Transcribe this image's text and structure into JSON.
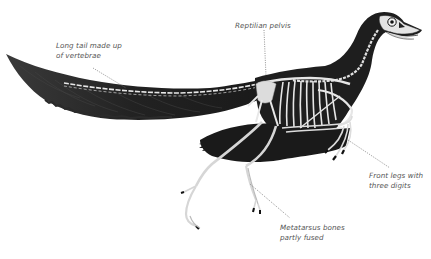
{
  "diagram": {
    "labels": [
      {
        "id": "tail",
        "line1": "Long tail made up",
        "line2": "of vertebrae"
      },
      {
        "id": "pelvis",
        "line1": "Reptilian pelvis"
      },
      {
        "id": "front_legs",
        "line1": "Front legs with",
        "line2": "three digits"
      },
      {
        "id": "metatarsus",
        "line1": "Metatarsus bones",
        "line2": "partly fused"
      }
    ],
    "cutoff_text": "Teeth in the beak",
    "colors": {
      "background": "#ffffff",
      "silhouette": "#1e1e1e",
      "bone": "#e6e6e6",
      "label_text": "#555555",
      "leader_line": "#777777"
    }
  }
}
